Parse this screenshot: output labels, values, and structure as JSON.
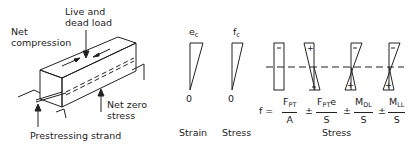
{
  "beam": {
    "label_live_dead_line1": "Live and",
    "label_live_dead_line2": "dead load",
    "label_net_compression_line1": "Net",
    "label_net_compression_line2": "compression",
    "label_net_zero_line1": "Net zero",
    "label_net_zero_line2": "stress",
    "label_strand": "Prestressing strand"
  },
  "strain_diagram": {
    "top_symbol": "e",
    "top_subscript": "c",
    "zero_label": "0",
    "caption": "Strain"
  },
  "stress_diagram": {
    "top_symbol": "f",
    "top_subscript": "c",
    "zero_label": "0",
    "caption": "Stress"
  },
  "stress_components": {
    "signs": [
      {
        "top": "−",
        "bottom": ""
      },
      {
        "top": "+",
        "bottom": "−"
      },
      {
        "top": "−",
        "bottom": "+"
      },
      {
        "top": "−",
        "bottom": "+"
      }
    ],
    "caption": "Stress"
  },
  "equation": {
    "lhs": "f =",
    "term1_num": "F",
    "term1_num_sub": "PT",
    "term1_den": "A",
    "op1": "±",
    "term2_num": "F",
    "term2_num_sub": "PT",
    "term2_num_suffix": "e",
    "term2_den": "S",
    "op2": "±",
    "term3_num": "M",
    "term3_num_sub": "DL",
    "term3_den": "S",
    "op3": "±",
    "term4_num": "M",
    "term4_num_sub": "LL",
    "term4_den": "S"
  },
  "colors": {
    "line": "#222222",
    "background": "#ffffff"
  }
}
